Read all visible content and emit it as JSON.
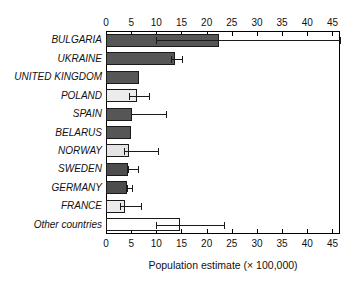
{
  "chart_data": {
    "type": "bar",
    "orientation": "horizontal",
    "title": "",
    "xlabel": "Population estimate (× 100,000)",
    "ylabel": "",
    "xlim": [
      0,
      46.5
    ],
    "xticks": [
      0,
      5,
      10,
      15,
      20,
      25,
      30,
      35,
      40,
      45
    ],
    "xticklabels": [
      "0",
      "5",
      "10",
      "15",
      "20",
      "25",
      "30",
      "35",
      "40",
      "45"
    ],
    "grid": false,
    "legend": false,
    "axis_top": true,
    "axis_bottom": true,
    "categories": [
      "BULGARIA",
      "UKRAINE",
      "UNITED KINGDOM",
      "POLAND",
      "SPAIN",
      "BELARUS",
      "NORWAY",
      "SWEDEN",
      "GERMANY",
      "FRANCE",
      "Other countries"
    ],
    "values": [
      22.4,
      13.8,
      6.5,
      6.2,
      5.2,
      5.0,
      4.5,
      4.4,
      4.2,
      3.8,
      14.7
    ],
    "error_low": [
      10.0,
      13.0,
      null,
      4.6,
      5.0,
      null,
      3.6,
      4.4,
      4.2,
      2.8,
      10.0
    ],
    "error_high": [
      46.5,
      15.2,
      null,
      8.6,
      12.0,
      null,
      10.3,
      6.4,
      5.2,
      7.0,
      23.5
    ],
    "bar_fills": [
      "#565656",
      "#565656",
      "#565656",
      "#ececec",
      "#565656",
      "#565656",
      "#e4e4e4",
      "#4d4d4d",
      "#4d4d4d",
      "#ebebeb",
      "#ffffff"
    ],
    "bar_edge_color": "#1a1a1a",
    "error_color": "#1a1a1a",
    "axis_color": "#000000",
    "background": "#ffffff"
  }
}
